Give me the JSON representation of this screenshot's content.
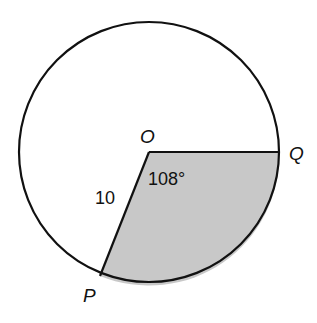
{
  "diagram": {
    "center_label": "O",
    "point_q_label": "Q",
    "point_p_label": "P",
    "radius_label": "10",
    "angle_label": "108°",
    "shaded_color": "#c8c8c8",
    "stroke_color": "#111111"
  }
}
